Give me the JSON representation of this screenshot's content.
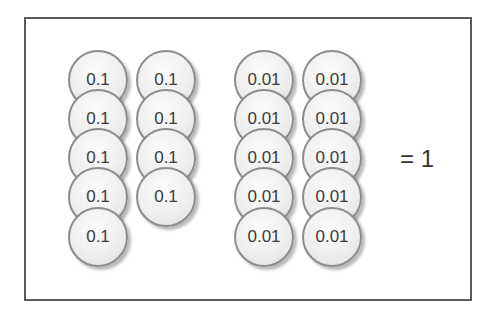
{
  "diagram": {
    "groups": [
      {
        "columns": [
          {
            "x": 68,
            "coins": [
              "0.1",
              "0.1",
              "0.1",
              "0.1",
              "0.1"
            ]
          },
          {
            "x": 136,
            "coins": [
              "0.1",
              "0.1",
              "0.1",
              "0.1"
            ]
          }
        ]
      },
      {
        "columns": [
          {
            "x": 234,
            "coins": [
              "0.01",
              "0.01",
              "0.01",
              "0.01",
              "0.01"
            ]
          },
          {
            "x": 302,
            "coins": [
              "0.01",
              "0.01",
              "0.01",
              "0.01",
              "0.01"
            ]
          }
        ]
      }
    ],
    "row_tops": [
      50,
      89,
      128,
      167,
      207
    ],
    "result": "= 1"
  }
}
